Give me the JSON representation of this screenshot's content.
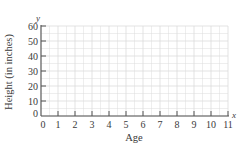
{
  "chart_data": {
    "type": "scatter",
    "title": "",
    "xlabel": "Age",
    "ylabel": "Height (in inches)",
    "x_var": "x",
    "y_var": "y",
    "xlim": [
      0,
      11
    ],
    "ylim": [
      0,
      60
    ],
    "x_ticks": [
      "0",
      "1",
      "2",
      "3",
      "4",
      "5",
      "6",
      "7",
      "8",
      "9",
      "10",
      "11"
    ],
    "y_ticks": [
      "0",
      "10",
      "20",
      "30",
      "40",
      "50",
      "60"
    ],
    "grid": true,
    "series": [],
    "colors": {
      "axis": "#555555",
      "grid": "#dcdcdc",
      "text": "#3a3a3a"
    }
  }
}
